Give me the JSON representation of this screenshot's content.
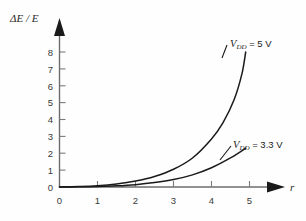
{
  "chart_data": {
    "type": "line",
    "title": "",
    "xlabel": "r",
    "ylabel": "ΔE / E",
    "xlim": [
      0,
      5.6
    ],
    "ylim": [
      0,
      8.6
    ],
    "xticks": [
      "0",
      "1",
      "2",
      "3",
      "4",
      "5"
    ],
    "yticks": [
      "0",
      "1",
      "2",
      "3",
      "4",
      "5",
      "6",
      "7",
      "8"
    ],
    "grid": false,
    "legend_position": "inline-annotation",
    "series": [
      {
        "name": "V_DD = 5 V",
        "label_text": "= 5 V",
        "symbol": "V",
        "subscript": "DD",
        "x": [
          0,
          0.5,
          1.0,
          1.5,
          2.0,
          2.5,
          3.0,
          3.5,
          4.0,
          4.3,
          4.6,
          4.8,
          4.9
        ],
        "y": [
          0,
          0.03,
          0.08,
          0.18,
          0.35,
          0.62,
          1.05,
          1.72,
          2.85,
          3.8,
          5.2,
          6.7,
          8.0
        ]
      },
      {
        "name": "V_DD = 3.3 V",
        "label_text": "= 3.3 V",
        "symbol": "V",
        "subscript": "DD",
        "x": [
          0,
          0.5,
          1.0,
          1.5,
          2.0,
          2.5,
          3.0,
          3.5,
          4.0,
          4.5,
          4.9
        ],
        "y": [
          0,
          0.01,
          0.03,
          0.07,
          0.14,
          0.26,
          0.44,
          0.72,
          1.14,
          1.72,
          2.3
        ]
      }
    ]
  },
  "labels": {
    "y_axis_title": "ΔE / E",
    "x_axis_title": "r",
    "curve_high": {
      "symbol": "V",
      "subscript": "DD",
      "value": "= 5 V"
    },
    "curve_low": {
      "symbol": "V",
      "subscript": "DD",
      "value": "= 3.3 V"
    }
  },
  "colors": {
    "curve": "#1a1a1a",
    "axis": "#6d6d6d",
    "background": "#fefefe",
    "tick_text": "#3a3a3a"
  }
}
